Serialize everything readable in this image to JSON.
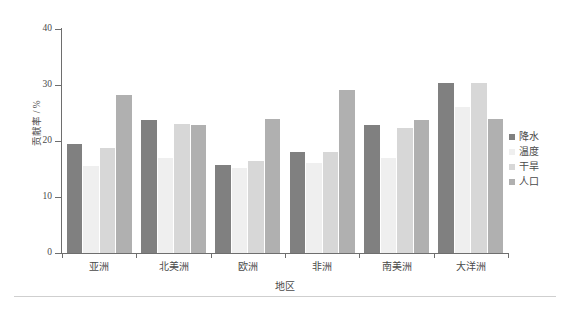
{
  "chart_data": {
    "type": "bar",
    "title": "",
    "subtitle": "",
    "xlabel": "地区",
    "ylabel": "贡献率 / %",
    "ylim": [
      0,
      40
    ],
    "yticks": [
      0,
      10,
      20,
      30,
      40
    ],
    "ytick_labels": [
      "0",
      "10",
      "20",
      "30",
      "40"
    ],
    "grid": false,
    "legend_position": "right",
    "categories": [
      "亚洲",
      "北美洲",
      "欧洲",
      "非洲",
      "南美洲",
      "大洋洲"
    ],
    "series": [
      {
        "name": "降水",
        "color": "#808080",
        "values": [
          19.5,
          23.7,
          15.8,
          18.0,
          22.8,
          30.4
        ]
      },
      {
        "name": "温度",
        "color": "#efefef",
        "values": [
          15.5,
          17.0,
          15.2,
          16.0,
          17.0,
          26.0
        ]
      },
      {
        "name": "干旱",
        "color": "#d7d7d7",
        "values": [
          18.8,
          23.0,
          16.4,
          18.1,
          22.4,
          30.3
        ]
      },
      {
        "name": "人口",
        "color": "#b0b0b0",
        "values": [
          28.3,
          22.8,
          24.0,
          29.1,
          23.8,
          24.0
        ]
      }
    ]
  },
  "figure": {
    "background": "#ffffff",
    "axis_color": "#6e6e6e",
    "text_color": "#4a4a4a",
    "footer_rule_color": "#cfcfcf"
  }
}
